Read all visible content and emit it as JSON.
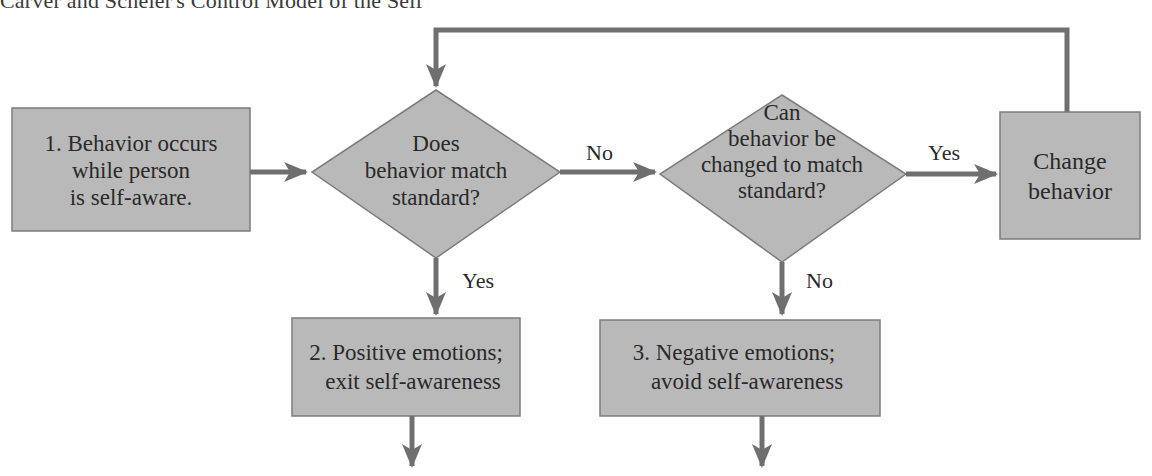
{
  "title": "Carver and Scheier's Control Model of the Self",
  "colors": {
    "fill": "#b9b9b9",
    "stroke": "#7c7c7c",
    "arrow": "#6f6f6f",
    "text": "#2a2a2a"
  },
  "nodes": {
    "start": {
      "lines": [
        "1. Behavior occurs",
        "while person",
        "is self-aware."
      ]
    },
    "decision1": {
      "lines": [
        "Does",
        "behavior match",
        "standard?"
      ]
    },
    "decision2": {
      "lines": [
        "Can",
        "behavior be",
        "changed to match",
        "standard?"
      ]
    },
    "change": {
      "lines": [
        "Change",
        "behavior"
      ]
    },
    "positive": {
      "lines": [
        "2. Positive emotions;",
        "exit self-awareness"
      ]
    },
    "negative": {
      "lines": [
        "3. Negative emotions;",
        "avoid self-awareness"
      ]
    }
  },
  "edges": {
    "d1_no": "No",
    "d1_yes": "Yes",
    "d2_yes": "Yes",
    "d2_no": "No"
  }
}
